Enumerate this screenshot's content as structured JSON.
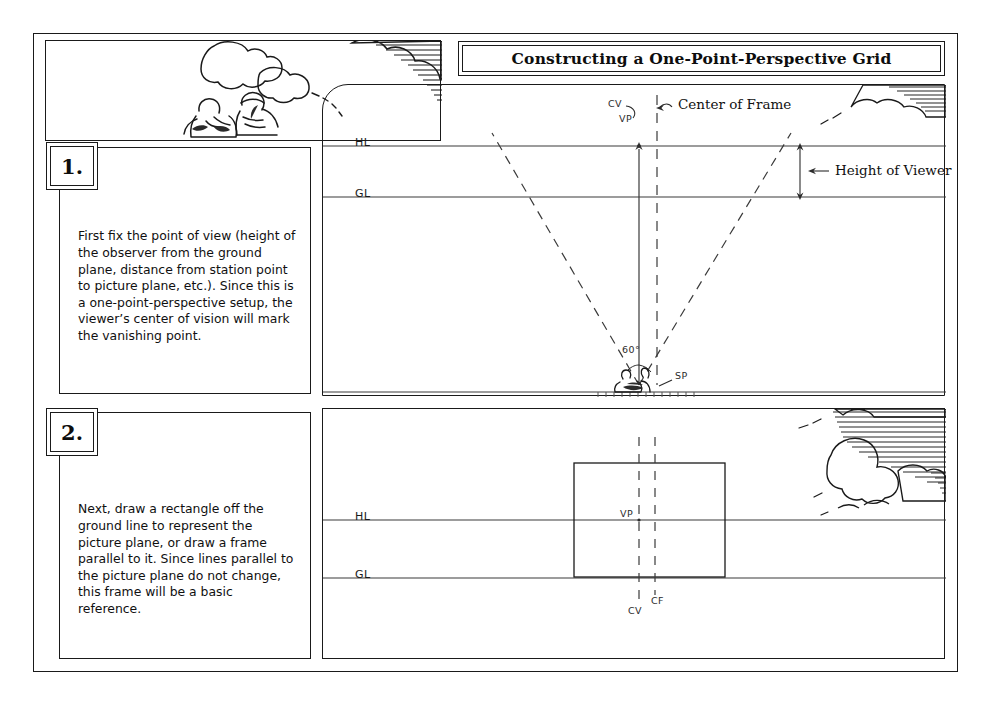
{
  "document": {
    "title": "Constructing a One-Point-Perspective Grid"
  },
  "steps": [
    {
      "number": "1.",
      "text": "First fix the point of view (height of the observer from the ground plane, distance from station point to picture plane, etc.). Since this is a one-point-perspective setup, the viewer’s center of vision will mark the vanishing point."
    },
    {
      "number": "2.",
      "text": "Next, draw a rectangle off the ground line to represent the picture plane, or draw a frame parallel to it. Since lines parallel to the picture plane do not change, this frame will be a basic reference."
    }
  ],
  "diagram_1": {
    "name": "point-of-view-setup",
    "labels": {
      "horizon_line": "HL",
      "ground_line": "GL",
      "center_of_vision": "CV",
      "vanishing_point": "VP",
      "center_of_frame": "Center of Frame",
      "height_of_viewer": "Height of Viewer",
      "cone_of_vision_angle": "60°",
      "station_point": "SP"
    }
  },
  "diagram_2": {
    "name": "picture-plane-frame",
    "labels": {
      "horizon_line": "HL",
      "ground_line": "GL",
      "vanishing_point": "VP",
      "center_of_vision": "CV",
      "center_of_frame": "CF"
    }
  },
  "colors": {
    "ink": "#1a1a1a",
    "paper": "#ffffff",
    "construction_line": "#555555"
  }
}
